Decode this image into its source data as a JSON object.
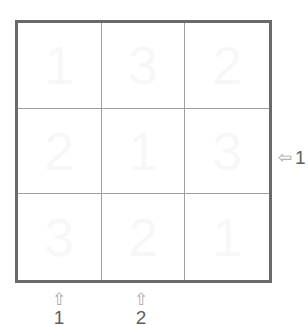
{
  "puzzle": {
    "type": "latin-square-grid",
    "size": 3,
    "grid": {
      "rows": [
        {
          "cells": [
            {
              "value": "1"
            },
            {
              "value": "3"
            },
            {
              "value": "2"
            }
          ]
        },
        {
          "cells": [
            {
              "value": "2"
            },
            {
              "value": "1"
            },
            {
              "value": "3"
            }
          ]
        },
        {
          "cells": [
            {
              "value": "3"
            },
            {
              "value": "2"
            },
            {
              "value": "1"
            }
          ]
        }
      ]
    },
    "clues": {
      "bottom": [
        {
          "id": "bottom-1",
          "arrow_icon": "arrow-up-outline",
          "arrow_glyph": "⇧",
          "label": "1",
          "column": 1
        },
        {
          "id": "bottom-2",
          "arrow_icon": "arrow-up-outline",
          "arrow_glyph": "⇧",
          "label": "2",
          "column": 2
        }
      ],
      "right": [
        {
          "id": "right-1",
          "arrow_icon": "arrow-left-outline",
          "arrow_glyph": "⇦",
          "label": "1",
          "row": 2
        }
      ]
    },
    "colors": {
      "background": "#ffffff",
      "outer_border": "#6a6a6a",
      "inner_grid_line": "#a0a0a0",
      "cell_value": "#f7f7f7",
      "clue_arrow": "#a8a8a8",
      "clue_label": "#5f5f5f"
    }
  }
}
